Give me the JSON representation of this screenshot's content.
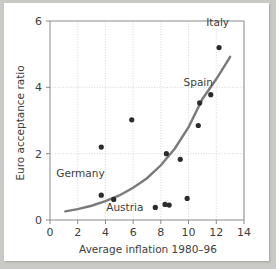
{
  "chart_data": {
    "type": "scatter",
    "title": "",
    "xlabel": "Average inflation 1980–96",
    "ylabel": "Euro acceptance ratio",
    "xlim": [
      0,
      14
    ],
    "ylim": [
      0,
      6
    ],
    "xticks": [
      0,
      2,
      4,
      6,
      8,
      10,
      12,
      14
    ],
    "yticks": [
      0,
      2,
      4,
      6
    ],
    "xtick_labels": [
      "0",
      "2",
      "4",
      "6",
      "8",
      "10",
      "12",
      "14"
    ],
    "ytick_labels": [
      "0",
      "2",
      "4",
      "6"
    ],
    "grid": true,
    "legend": "none",
    "points": [
      {
        "x": 3.7,
        "y": 2.2,
        "label": ""
      },
      {
        "x": 3.7,
        "y": 0.75,
        "label": "Germany"
      },
      {
        "x": 4.6,
        "y": 0.62,
        "label": "Austria"
      },
      {
        "x": 5.9,
        "y": 3.02,
        "label": ""
      },
      {
        "x": 7.6,
        "y": 0.38,
        "label": ""
      },
      {
        "x": 8.3,
        "y": 0.47,
        "label": ""
      },
      {
        "x": 8.6,
        "y": 0.45,
        "label": ""
      },
      {
        "x": 8.4,
        "y": 2.0,
        "label": ""
      },
      {
        "x": 9.4,
        "y": 1.83,
        "label": ""
      },
      {
        "x": 9.9,
        "y": 0.65,
        "label": ""
      },
      {
        "x": 10.7,
        "y": 2.85,
        "label": ""
      },
      {
        "x": 10.8,
        "y": 3.53,
        "label": ""
      },
      {
        "x": 11.6,
        "y": 3.78,
        "label": "Spain"
      },
      {
        "x": 12.2,
        "y": 5.2,
        "label": "Italy"
      }
    ],
    "annotations": [
      {
        "text": "Italy",
        "x": 12.1,
        "y": 5.85
      },
      {
        "text": "Spain",
        "x": 10.7,
        "y": 4.05
      },
      {
        "text": "Germany",
        "x": 2.2,
        "y": 1.3
      },
      {
        "text": "Austria",
        "x": 5.4,
        "y": 0.28
      }
    ],
    "trend_curve": {
      "description": "exponential fit",
      "x_start": 1.1,
      "x_end": 13.0,
      "formula_points": [
        {
          "x": 1.1,
          "y": 0.26
        },
        {
          "x": 2.0,
          "y": 0.33
        },
        {
          "x": 3.0,
          "y": 0.43
        },
        {
          "x": 4.0,
          "y": 0.57
        },
        {
          "x": 5.0,
          "y": 0.74
        },
        {
          "x": 6.0,
          "y": 0.97
        },
        {
          "x": 7.0,
          "y": 1.26
        },
        {
          "x": 8.0,
          "y": 1.65
        },
        {
          "x": 9.0,
          "y": 2.15
        },
        {
          "x": 10.0,
          "y": 2.8
        },
        {
          "x": 11.0,
          "y": 3.65
        },
        {
          "x": 12.0,
          "y": 4.25
        },
        {
          "x": 13.0,
          "y": 4.92
        }
      ]
    },
    "colors": {
      "point": "#2b2b2b",
      "curve": "#7a7a7a",
      "grid": "#c5c5c5",
      "axis": "#8a8a8a",
      "text": "#3d3d3d",
      "figure_background": "#ffffff",
      "page_background": "#c9cac6"
    }
  }
}
